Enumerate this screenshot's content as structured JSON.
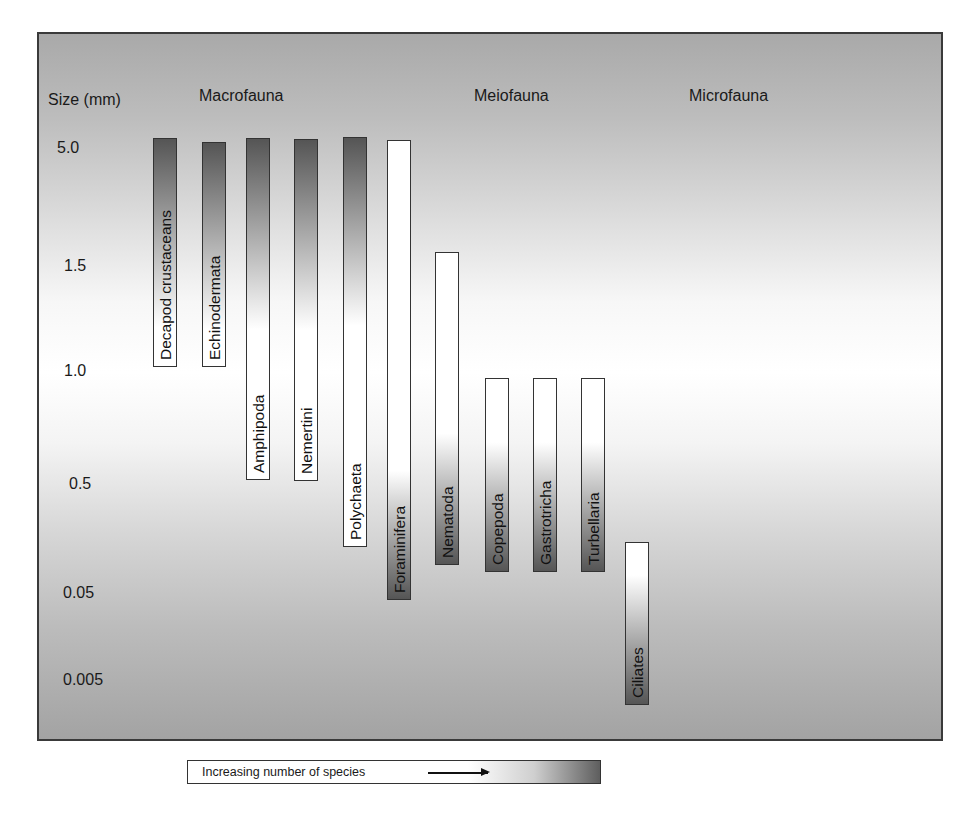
{
  "chart_data": {
    "type": "range-bar",
    "title": "",
    "ylabel": "Size (mm)",
    "y_ticks": [
      "5.0",
      "1.5",
      "1.0",
      "0.5",
      "0.05",
      "0.005"
    ],
    "groups": [
      "Macrofauna",
      "Meiofauna",
      "Microfauna"
    ],
    "legend": "Increasing number of species",
    "legend_note": "Shading from white (few species) to dark gray (many species)",
    "series": [
      {
        "name": "Decapod crustaceans",
        "group": "Macrofauna",
        "max_mm": "5.0",
        "min_mm": "1.0",
        "dark_end": "top"
      },
      {
        "name": "Echinodermata",
        "group": "Macrofauna",
        "max_mm": "5.0",
        "min_mm": "1.0",
        "dark_end": "top"
      },
      {
        "name": "Amphipoda",
        "group": "Macrofauna",
        "max_mm": "5.0",
        "min_mm": "0.5",
        "dark_end": "top"
      },
      {
        "name": "Nemertini",
        "group": "Macrofauna",
        "max_mm": "5.0",
        "min_mm": "0.5",
        "dark_end": "top"
      },
      {
        "name": "Polychaeta",
        "group": "Macrofauna",
        "max_mm": "5.0",
        "min_mm": "0.1",
        "dark_end": "top"
      },
      {
        "name": "Foraminifera",
        "group": "Meiofauna",
        "max_mm": "5.0",
        "min_mm": "0.05",
        "dark_end": "bottom"
      },
      {
        "name": "Nematoda",
        "group": "Meiofauna",
        "max_mm": "1.5",
        "min_mm": "0.07",
        "dark_end": "bottom"
      },
      {
        "name": "Copepoda",
        "group": "Meiofauna",
        "max_mm": "1.0",
        "min_mm": "0.06",
        "dark_end": "bottom"
      },
      {
        "name": "Gastrotricha",
        "group": "Meiofauna",
        "max_mm": "1.0",
        "min_mm": "0.06",
        "dark_end": "bottom"
      },
      {
        "name": "Turbellaria",
        "group": "Meiofauna",
        "max_mm": "1.0",
        "min_mm": "0.06",
        "dark_end": "bottom"
      },
      {
        "name": "Ciliates",
        "group": "Microfauna",
        "max_mm": "0.1",
        "min_mm": "0.005",
        "dark_end": "bottom"
      }
    ]
  },
  "axis": {
    "title": "Size (mm)",
    "ticks": [
      {
        "label": "5.0",
        "x": 57,
        "y": 140
      },
      {
        "label": "1.5",
        "x": 64,
        "y": 258
      },
      {
        "label": "1.0",
        "x": 64,
        "y": 363
      },
      {
        "label": "0.5",
        "x": 69,
        "y": 476
      },
      {
        "label": "0.05",
        "x": 63,
        "y": 585
      },
      {
        "label": "0.005",
        "x": 63,
        "y": 672
      }
    ]
  },
  "groups": [
    {
      "label": "Macrofauna",
      "x": 199,
      "y": 88
    },
    {
      "label": "Meiofauna",
      "x": 474,
      "y": 88
    },
    {
      "label": "Microfauna",
      "x": 689,
      "y": 88
    }
  ],
  "bars": [
    {
      "label": "Decapod crustaceans",
      "x": 153,
      "top": 138,
      "bottom": 367,
      "fill": "top"
    },
    {
      "label": "Echinodermata",
      "x": 202,
      "top": 142,
      "bottom": 367,
      "fill": "top"
    },
    {
      "label": "Amphipoda",
      "x": 246,
      "top": 138,
      "bottom": 480,
      "fill": "top"
    },
    {
      "label": "Nemertini",
      "x": 294,
      "top": 139,
      "bottom": 481,
      "fill": "top"
    },
    {
      "label": "Polychaeta",
      "x": 343,
      "top": 137,
      "bottom": 547,
      "fill": "top"
    },
    {
      "label": "Foraminifera",
      "x": 387,
      "top": 140,
      "bottom": 600,
      "fill": "bottom"
    },
    {
      "label": "Nematoda",
      "x": 435,
      "top": 252,
      "bottom": 565,
      "fill": "bottom"
    },
    {
      "label": "Copepoda",
      "x": 485,
      "top": 378,
      "bottom": 572,
      "fill": "bottom"
    },
    {
      "label": "Gastrotricha",
      "x": 533,
      "top": 378,
      "bottom": 572,
      "fill": "bottom"
    },
    {
      "label": "Turbellaria",
      "x": 581,
      "top": 378,
      "bottom": 572,
      "fill": "bottom"
    },
    {
      "label": "Ciliates",
      "x": 625,
      "top": 542,
      "bottom": 705,
      "fill": "bottom"
    }
  ],
  "legend": {
    "label": "Increasing number of species",
    "arrow": "right-arrow-icon"
  },
  "colors": {
    "dark": "#555555",
    "light": "#ffffff",
    "border": "#333333"
  }
}
